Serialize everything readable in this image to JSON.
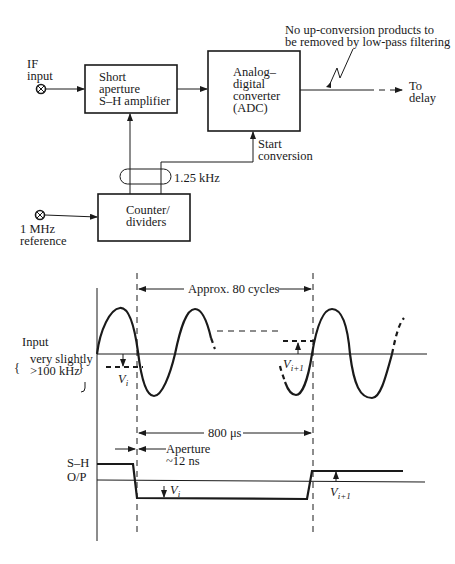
{
  "block_diagram": {
    "if_input": {
      "line1": "IF",
      "line2": "input"
    },
    "sh_amplifier": {
      "line1": "Short",
      "line2": "aperture",
      "line3": "S–H amplifier"
    },
    "adc": {
      "line1": "Analog–",
      "line2": "digital",
      "line3": "converter",
      "line4": "(ADC)"
    },
    "note": {
      "line1": "No up-conversion products to",
      "line2": "be removed by low-pass filtering"
    },
    "output": {
      "line1": "To",
      "line2": "delay"
    },
    "start_conversion": {
      "line1": "Start",
      "line2": "conversion"
    },
    "clock_rate": "1.25 kHz",
    "counter": {
      "line1": "Counter/",
      "line2": "dividers"
    },
    "reference": {
      "line1": "1 MHz",
      "line2": "reference"
    }
  },
  "timing_diagram": {
    "interval_label": "Approx. 80 cycles",
    "input_label": "Input",
    "input_freq": {
      "line1": "very slightly",
      "line2": ">100 kHz"
    },
    "sample_i": "V",
    "sample_i_sub": "i",
    "sample_i1": "V",
    "sample_i1_sub": "i+1",
    "period_label": "800 μs",
    "aperture": {
      "line1": "Aperture",
      "line2": "~12 ns"
    },
    "sh_output": {
      "line1": "S–H",
      "line2": "O/P"
    }
  }
}
